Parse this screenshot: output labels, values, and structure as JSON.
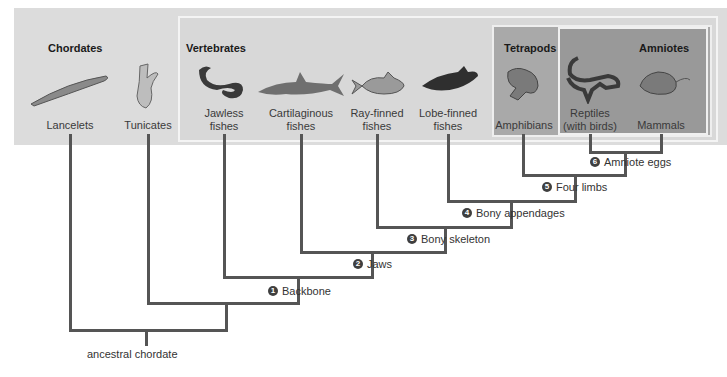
{
  "groups": {
    "chordates": "Chordates",
    "vertebrates": "Vertebrates",
    "tetrapods": "Tetrapods",
    "amniotes": "Amniotes"
  },
  "taxa": [
    {
      "id": "lancelets",
      "line1": "Lancelets",
      "line2": "",
      "icon": "lancelet-icon"
    },
    {
      "id": "tunicates",
      "line1": "Tunicates",
      "line2": "",
      "icon": "tunicate-icon"
    },
    {
      "id": "jawless",
      "line1": "Jawless",
      "line2": "fishes",
      "icon": "lamprey-icon"
    },
    {
      "id": "cartilaginous",
      "line1": "Cartilaginous",
      "line2": "fishes",
      "icon": "shark-icon"
    },
    {
      "id": "rayfinned",
      "line1": "Ray-finned",
      "line2": "fishes",
      "icon": "perch-icon"
    },
    {
      "id": "lobefinned",
      "line1": "Lobe-finned",
      "line2": "fishes",
      "icon": "coelacanth-icon"
    },
    {
      "id": "amphibians",
      "line1": "Amphibians",
      "line2": "",
      "icon": "frog-icon"
    },
    {
      "id": "reptiles",
      "line1": "Reptiles",
      "line2": "(with birds)",
      "icon": "lizard-icon"
    },
    {
      "id": "mammals",
      "line1": "Mammals",
      "line2": "",
      "icon": "mouse-icon"
    }
  ],
  "traits": [
    {
      "num": "1",
      "label": "Backbone"
    },
    {
      "num": "2",
      "label": "Jaws"
    },
    {
      "num": "3",
      "label": "Bony skeleton"
    },
    {
      "num": "4",
      "label": "Bony appendages"
    },
    {
      "num": "5",
      "label": "Four limbs"
    },
    {
      "num": "6",
      "label": "Amniote eggs"
    }
  ],
  "root": "ancestral chordate",
  "colors": {
    "outer_box": "#dcdcdc",
    "tetrapods_box": "#a9a9a9",
    "amniotes_box": "#999999",
    "tree_line": "#555555"
  }
}
